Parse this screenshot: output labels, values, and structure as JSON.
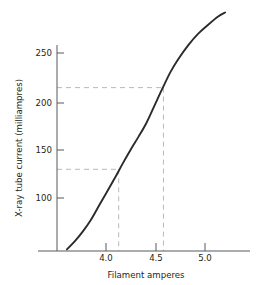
{
  "chart_data": {
    "type": "line",
    "title": "",
    "xlabel": "Filament amperes",
    "ylabel": "X-ray tube current (milliampres)",
    "xlim": [
      3.48,
      5.42
    ],
    "ylim": [
      0,
      295
    ],
    "grid": false,
    "legend": null,
    "xticks": [
      4.0,
      4.5,
      5.0
    ],
    "xtick_labels": [
      "4.0",
      "4.5",
      "5.0"
    ],
    "yticks": [
      100,
      150,
      200,
      250
    ],
    "ytick_labels": [
      "100",
      "150",
      "200",
      "250"
    ],
    "series": [
      {
        "name": "Tube current characteristic",
        "x": [
          3.58,
          3.66,
          3.74,
          3.82,
          3.9,
          3.98,
          4.06,
          4.14,
          4.22,
          4.3,
          4.38,
          4.46,
          4.54,
          4.62,
          4.7,
          4.8,
          4.9,
          5.0,
          5.1,
          5.17
        ],
        "y": [
          2,
          12,
          24,
          38,
          55,
          72,
          89,
          107,
          124,
          140,
          157,
          178,
          199,
          219,
          235,
          252,
          266,
          277,
          287,
          292
        ]
      }
    ],
    "annotations": [
      {
        "name": "guide-100",
        "type": "crosshair",
        "x": 4.1,
        "y": 100,
        "style": "dashed",
        "color": "#b9b9b9"
      },
      {
        "name": "guide-200",
        "type": "crosshair",
        "x": 4.55,
        "y": 200,
        "style": "dashed",
        "color": "#b9b9b9"
      }
    ],
    "colors": {
      "curve": "#2b2b2b",
      "axis": "#4a4a4a",
      "guide": "#b9b9b9",
      "text": "#231f20",
      "background": "#ffffff"
    }
  }
}
